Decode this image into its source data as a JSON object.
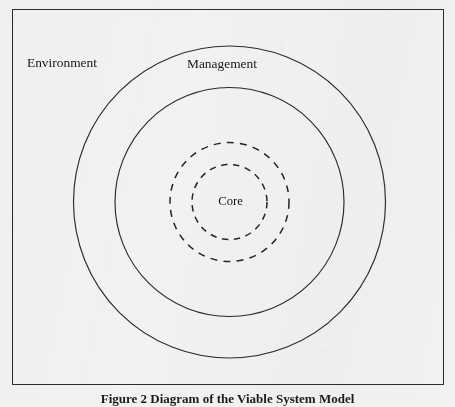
{
  "figure": {
    "caption": "Figure 2 Diagram of the Viable System Model",
    "background_color": "#f3f2f0",
    "line_color": "#2b2b2b",
    "text_color": "#171717"
  },
  "frame": {
    "name": "figure-border"
  },
  "diagram": {
    "type": "concentric-rings",
    "center": {
      "x": 229.5,
      "y": 202
    },
    "labels": {
      "environment": "Environment",
      "management": "Management",
      "core": "Core"
    },
    "rings": [
      {
        "name": "environment-ring",
        "radius": 156,
        "style": "solid",
        "label": "Environment"
      },
      {
        "name": "management-ring",
        "radius": 114.5,
        "style": "solid",
        "label": "Management"
      },
      {
        "name": "outer-core-boundary",
        "radius": 59.5,
        "style": "dashed",
        "label": ""
      },
      {
        "name": "inner-core-boundary",
        "radius": 37.5,
        "style": "dashed",
        "label": "Core"
      }
    ]
  }
}
